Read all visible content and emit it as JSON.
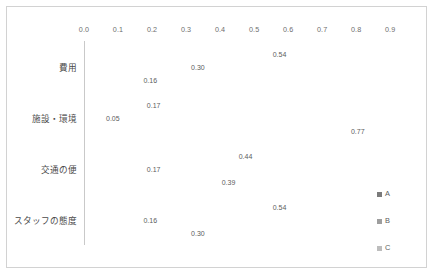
{
  "chart_data": {
    "type": "bar",
    "orientation": "horizontal",
    "title": "",
    "xlabel": "",
    "ylabel": "",
    "xlim": [
      0.0,
      0.97
    ],
    "grid": false,
    "legend_position": "right",
    "xticks": [
      "0.0",
      "0.1",
      "0.2",
      "0.3",
      "0.4",
      "0.5",
      "0.6",
      "0.7",
      "0.8",
      "0.9"
    ],
    "xtick_values": [
      0.0,
      0.1,
      0.2,
      0.3,
      0.4,
      0.5,
      0.6,
      0.7,
      0.8,
      0.9
    ],
    "categories": [
      "費用",
      "施設・環境",
      "交通の便",
      "スタッフの態度"
    ],
    "series": [
      {
        "name": "A",
        "color": "#7b7b7b",
        "values": [
          0.54,
          0.17,
          0.44,
          0.54
        ],
        "labels": [
          "0.54",
          "0.17",
          "0.44",
          "0.54"
        ]
      },
      {
        "name": "B",
        "color": "#9e9e9e",
        "values": [
          0.3,
          0.05,
          0.17,
          0.16
        ],
        "labels": [
          "0.30",
          "0.05",
          "0.17",
          "0.16"
        ]
      },
      {
        "name": "C",
        "color": "#bdbdbd",
        "values": [
          0.16,
          0.77,
          0.39,
          0.3
        ],
        "labels": [
          "0.16",
          "0.77",
          "0.39",
          "0.30"
        ]
      }
    ]
  },
  "legend": {
    "items": [
      {
        "label": "A"
      },
      {
        "label": "B"
      },
      {
        "label": "C"
      }
    ]
  },
  "colors": {
    "series_a": "#7b7b7b",
    "series_b": "#9e9e9e",
    "series_c": "#bdbdbd",
    "frame_border": "#d2d2d2",
    "axis_line": "#c9c9c9",
    "tick_text": "#6e6e6e",
    "label_text": "#4a4a4a",
    "value_text": "#5d5d5d",
    "background": "#ffffff"
  }
}
